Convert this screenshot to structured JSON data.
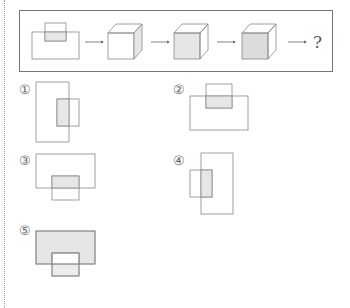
{
  "sequence": {
    "question_mark": "?",
    "figures": [
      "front-view-overlapping-rects",
      "cube-right-face-shaded",
      "cube-front-face-shaded",
      "cube-front-face-shaded-darker"
    ]
  },
  "options": [
    {
      "label": "①",
      "description": "tall rect with small rect overlapping lower-right"
    },
    {
      "label": "②",
      "description": "wide rect with small rect overlapping top"
    },
    {
      "label": "③",
      "description": "wide rect with small rect overlapping bottom"
    },
    {
      "label": "④",
      "description": "tall rect with small rect overlapping left"
    },
    {
      "label": "⑤",
      "description": "shaded wide rect with small rect overlapping bottom"
    }
  ],
  "colors": {
    "line": "#888888",
    "shade": "#e6e6e6",
    "shade_dark": "#dcdcdc"
  }
}
